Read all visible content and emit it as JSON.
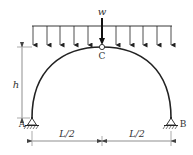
{
  "diagram": {
    "labels": {
      "load": "w",
      "crown_hinge": "C",
      "left_support": "A",
      "right_support": "B",
      "height": "h",
      "left_span": "L/2",
      "right_span": "L/2"
    },
    "colors": {
      "line": "#222222",
      "dim": "#555555",
      "text": "#333333"
    },
    "load_arrow_count": 11
  }
}
